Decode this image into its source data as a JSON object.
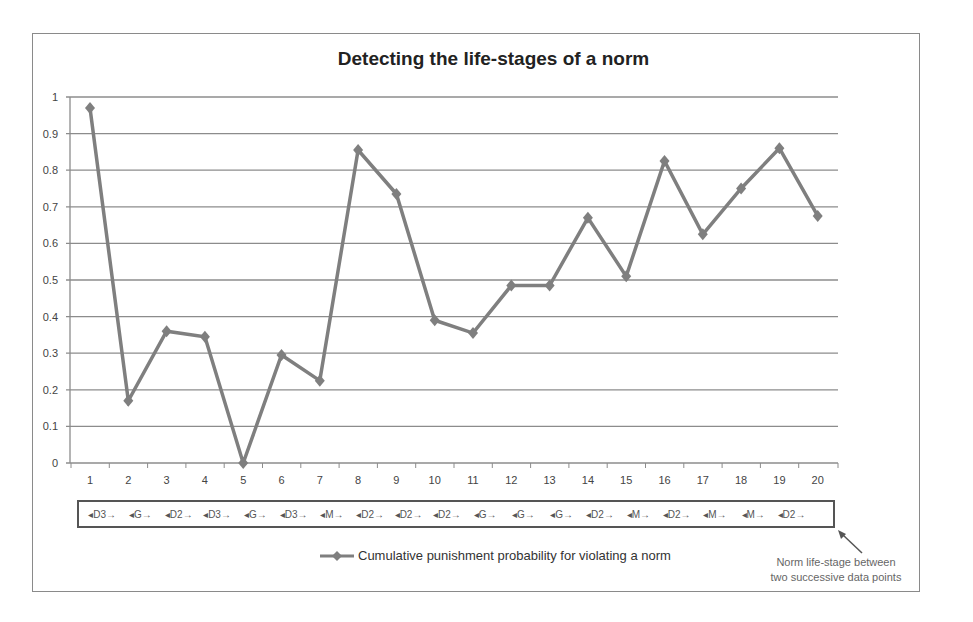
{
  "chart_data": {
    "type": "line",
    "title": "Detecting the life-stages of a norm",
    "xlabel": "",
    "ylabel": "",
    "x": [
      1,
      2,
      3,
      4,
      5,
      6,
      7,
      8,
      9,
      10,
      11,
      12,
      13,
      14,
      15,
      16,
      17,
      18,
      19,
      20
    ],
    "series": [
      {
        "name": "Cumulative punishment probability for violating a norm",
        "values": [
          0.97,
          0.17,
          0.36,
          0.345,
          0.0,
          0.295,
          0.225,
          0.855,
          0.735,
          0.39,
          0.355,
          0.485,
          0.485,
          0.67,
          0.51,
          0.825,
          0.625,
          0.75,
          0.86,
          0.675
        ],
        "color": "#7f7f7f",
        "marker": "diamond"
      }
    ],
    "ylim": [
      0,
      1
    ],
    "yticks": [
      "0",
      "0.1",
      "0.2",
      "0.3",
      "0.4",
      "0.5",
      "0.6",
      "0.7",
      "0.8",
      "0.9",
      "1"
    ],
    "xticks": [
      "1",
      "2",
      "3",
      "4",
      "5",
      "6",
      "7",
      "8",
      "9",
      "10",
      "11",
      "12",
      "13",
      "14",
      "15",
      "16",
      "17",
      "18",
      "19",
      "20"
    ],
    "grid": true,
    "legend_position": "bottom",
    "life_stages": [
      "D3",
      "G",
      "D2",
      "D3",
      "G",
      "D3",
      "M",
      "D2",
      "D2",
      "D2",
      "G",
      "G",
      "G",
      "D2",
      "M",
      "D2",
      "M",
      "M",
      "D2"
    ],
    "annotation": "Norm life-stage between two successive data points"
  },
  "title": "Detecting the life-stages of a norm",
  "legend": {
    "label": "Cumulative punishment probability for violating a norm"
  },
  "annotation": {
    "line1": "Norm life-stage between",
    "line2": "two successive data points"
  },
  "stages": [
    "D3",
    "G",
    "D2",
    "D3",
    "G",
    "D3",
    "M",
    "D2",
    "D2",
    "D2",
    "G",
    "G",
    "G",
    "D2",
    "M",
    "D2",
    "M",
    "M",
    "D2"
  ]
}
